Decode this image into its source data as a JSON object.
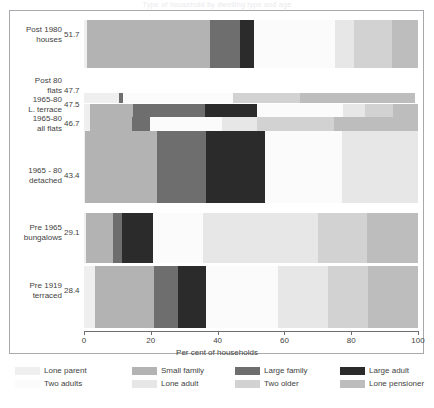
{
  "title_strip": "Type of household by dwelling type and age",
  "chart_data": {
    "type": "bar",
    "orientation": "horizontal",
    "stacked": true,
    "stack_unit": "percent",
    "title": "",
    "xlabel": "Per cent of households",
    "ylabel": "",
    "xlim": [
      0,
      100
    ],
    "xticks": [
      0,
      20,
      40,
      60,
      80,
      100
    ],
    "xticklabels": [
      "0",
      "20",
      "40",
      "60",
      "80",
      "100"
    ],
    "grid": false,
    "legend_position": "bottom",
    "categories": [
      {
        "name_line1": "Post 1980",
        "name_line2": "houses",
        "value": "51.7"
      },
      {
        "name_line1": "Post 80",
        "name_line2": "flats",
        "value": "47.7"
      },
      {
        "name_line1": "1965-80",
        "name_line2": "L. terrace",
        "value": "47.5"
      },
      {
        "name_line1": "1965-80",
        "name_line2": "all flats",
        "value": "46.7"
      },
      {
        "name_line1": "1965 - 80",
        "name_line2": "detached",
        "value": "43.4"
      },
      {
        "name_line1": "Pre 1965",
        "name_line2": "bungalows",
        "value": "29.1"
      },
      {
        "name_line1": "Pre 1919",
        "name_line2": "terraced",
        "value": "28.4"
      }
    ],
    "series": [
      {
        "name": "Lone parent",
        "color": "#efefef",
        "values": [
          1.0,
          10.5,
          1.8,
          1.8,
          0.3,
          0.6,
          3.3
        ]
      },
      {
        "name": "Small family",
        "color": "#b3b3b3",
        "values": [
          36.8,
          0.0,
          12.9,
          12.6,
          21.6,
          8.1,
          17.7
        ]
      },
      {
        "name": "Large family",
        "color": "#6e6e6e",
        "values": [
          9.0,
          1.2,
          21.6,
          5.4,
          14.7,
          2.7,
          7.2
        ]
      },
      {
        "name": "Large adult",
        "color": "#2b2b2b",
        "values": [
          4.2,
          0.0,
          15.6,
          0.0,
          17.7,
          9.3,
          8.4
        ]
      },
      {
        "name": "Two adults",
        "color": "#fbfbfb",
        "values": [
          24.2,
          33.0,
          25.7,
          21.6,
          23.1,
          15.0,
          21.6
        ]
      },
      {
        "name": "Lone adult",
        "color": "#e7e7e7",
        "values": [
          5.7,
          0.0,
          6.6,
          10.5,
          22.6,
          34.4,
          15.0
        ]
      },
      {
        "name": "Two older",
        "color": "#d2d2d2",
        "values": [
          11.4,
          20.0,
          8.4,
          23.1,
          0.0,
          14.7,
          11.7
        ]
      },
      {
        "name": "Lone pensioner",
        "color": "#bdbdbd",
        "values": [
          7.7,
          34.3,
          7.4,
          25.0,
          0.0,
          15.2,
          15.1
        ]
      }
    ],
    "legend_rows": [
      [
        "Lone parent",
        "Small family",
        "Large family",
        "Large adult"
      ],
      [
        "Two adults",
        "Lone adult",
        "Two older",
        "Lone pensioner"
      ]
    ]
  }
}
